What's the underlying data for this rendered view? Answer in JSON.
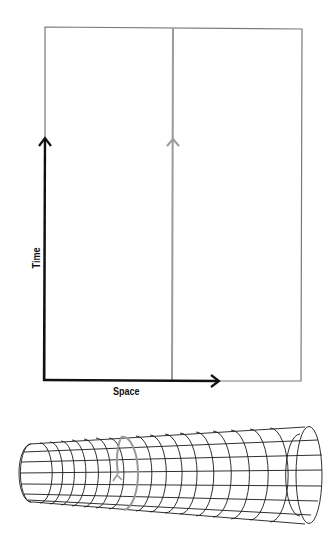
{
  "diagram": {
    "type": "spacetime-diagram-with-cylinder",
    "axes": {
      "x_label": "Space",
      "y_label": "Time"
    },
    "colors": {
      "axis": "#111111",
      "frame": "#7a7a7a",
      "worldline": "#9a9a9a",
      "mesh": "#1a1a1a",
      "background": "#ffffff"
    },
    "panels": [
      {
        "name": "flat-spacetime",
        "description": "Rectangle with black time/space axes and a gray vertical worldline with an upward arrow"
      },
      {
        "name": "cylindrical-spacetime",
        "description": "Wireframe cone/cylinder grid with a gray ring worldline and small arrow"
      }
    ]
  }
}
